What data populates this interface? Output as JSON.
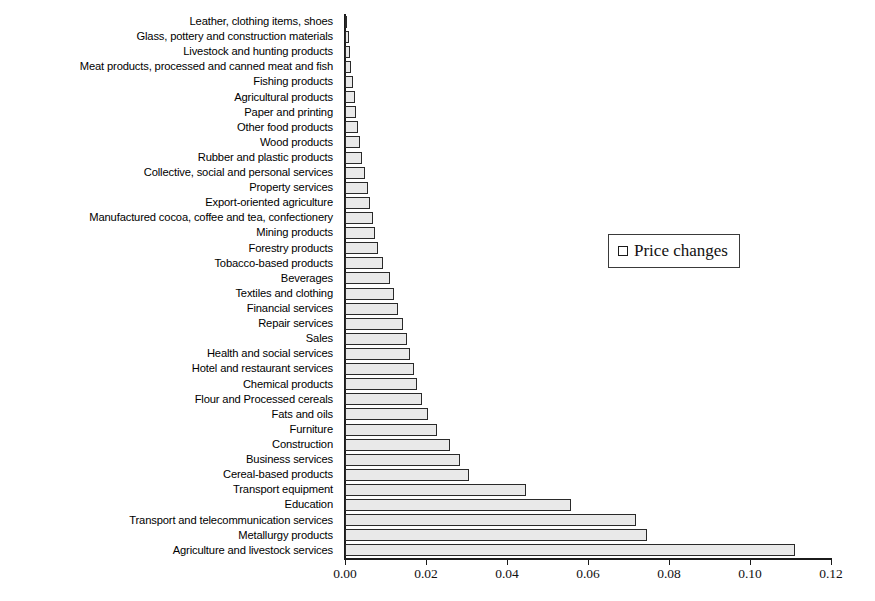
{
  "chart_data": {
    "type": "bar",
    "orientation": "horizontal",
    "title": "",
    "subtitle": "",
    "xlabel": "",
    "ylabel": "",
    "xlim": [
      0.0,
      0.12
    ],
    "xticks": [
      "0.00",
      "0.02",
      "0.04",
      "0.06",
      "0.08",
      "0.10",
      "0.12"
    ],
    "xtick_values": [
      0.0,
      0.02,
      0.04,
      0.06,
      0.08,
      0.1,
      0.12
    ],
    "grid": false,
    "legend": {
      "position": "center-right",
      "entries": [
        {
          "label": "Price changes",
          "marker": "square",
          "fill": "#ffffff",
          "edge": "#1b1b1b"
        }
      ]
    },
    "series": [
      {
        "name": "Price changes",
        "fill": "#e9e9e9",
        "edge": "#2a2a2a"
      }
    ],
    "categories": [
      "Leather, clothing items, shoes",
      "Glass, pottery and construction materials",
      "Livestock and hunting products",
      "Meat products, processed and canned meat and fish",
      "Fishing products",
      "Agricultural products",
      "Paper and printing",
      "Other food products",
      "Wood products",
      "Rubber and plastic products",
      "Collective, social and personal services",
      "Property services",
      "Export-oriented agriculture",
      "Manufactured cocoa, coffee and tea, confectionery",
      "Mining products",
      "Forestry products",
      "Tobacco-based products",
      "Beverages",
      "Textiles and clothing",
      "Financial services",
      "Repair services",
      "Sales",
      "Health and social services",
      "Hotel and restaurant services",
      "Chemical products",
      "Flour and Processed cereals",
      "Fats and oils",
      "Furniture",
      "Construction",
      "Business services",
      "Cereal-based products",
      "Transport equipment",
      "Education",
      "Transport and telecommunication services",
      "Metallurgy products",
      "Agriculture and livestock services"
    ],
    "values": [
      0.0002,
      0.0009,
      0.0013,
      0.0016,
      0.002,
      0.0024,
      0.0028,
      0.0033,
      0.0038,
      0.0043,
      0.005,
      0.0056,
      0.0062,
      0.0068,
      0.0074,
      0.0081,
      0.0094,
      0.011,
      0.0121,
      0.0131,
      0.0144,
      0.0152,
      0.016,
      0.017,
      0.0178,
      0.019,
      0.0206,
      0.0228,
      0.026,
      0.0284,
      0.0305,
      0.0448,
      0.0558,
      0.0718,
      0.0745,
      0.111
    ]
  }
}
